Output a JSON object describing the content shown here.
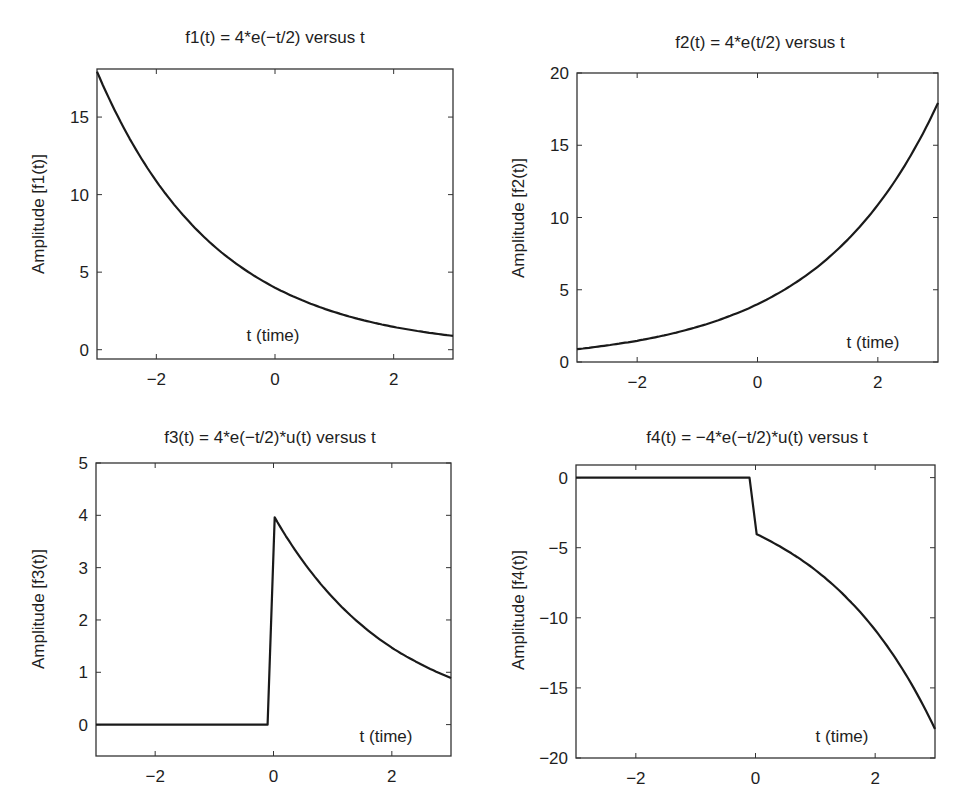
{
  "figure": {
    "layout": "2x2 subplots",
    "line_color": "#1a1a1a",
    "axes_color": "#333333",
    "background": "#ffffff"
  },
  "chart_data": [
    {
      "type": "line",
      "id": "f1",
      "title": "f1(t) = 4*e(−t/2) versus t",
      "xlabel": "t (time)",
      "ylabel": "Amplitude [f1(t)]",
      "xlim": [
        -3,
        3
      ],
      "ylim": [
        -0.6,
        18.1
      ],
      "xticks": [
        -2,
        0,
        2
      ],
      "xtick_labels": [
        "−2",
        "0",
        "2"
      ],
      "yticks": [
        0,
        5,
        10,
        15
      ],
      "ytick_labels": [
        "0",
        "5",
        "10",
        "15"
      ],
      "grid": false,
      "legend": null,
      "series": [
        {
          "name": "f1(t)",
          "x": [
            -3,
            -2.5,
            -2,
            -1.5,
            -1,
            -0.5,
            0,
            0.5,
            1,
            1.5,
            2,
            2.5,
            3
          ],
          "y": [
            17.93,
            13.96,
            10.87,
            8.47,
            6.59,
            5.14,
            4.0,
            3.12,
            2.43,
            1.89,
            1.47,
            1.15,
            0.89
          ]
        }
      ]
    },
    {
      "type": "line",
      "id": "f2",
      "title": "f2(t) = 4*e(t/2) versus t",
      "xlabel": "t (time)",
      "ylabel": "Amplitude [f2(t)]",
      "xlim": [
        -3,
        3
      ],
      "ylim": [
        0,
        20
      ],
      "xticks": [
        -2,
        0,
        2
      ],
      "xtick_labels": [
        "−2",
        "0",
        "2"
      ],
      "yticks": [
        0,
        5,
        10,
        15,
        20
      ],
      "ytick_labels": [
        "0",
        "5",
        "10",
        "15",
        "20"
      ],
      "grid": false,
      "legend": null,
      "series": [
        {
          "name": "f2(t)",
          "x": [
            -3,
            -2.5,
            -2,
            -1.5,
            -1,
            -0.5,
            0,
            0.5,
            1,
            1.5,
            2,
            2.5,
            3
          ],
          "y": [
            0.89,
            1.15,
            1.47,
            1.89,
            2.43,
            3.12,
            4.0,
            5.14,
            6.59,
            8.47,
            10.87,
            13.96,
            17.93
          ]
        }
      ]
    },
    {
      "type": "line",
      "id": "f3",
      "title": "f3(t) = 4*e(−t/2)*u(t) versus t",
      "xlabel": "t (time)",
      "ylabel": "Amplitude [f3(t)]",
      "xlim": [
        -3,
        3
      ],
      "ylim": [
        -0.6,
        5
      ],
      "xticks": [
        -2,
        0,
        2
      ],
      "xtick_labels": [
        "−2",
        "0",
        "2"
      ],
      "yticks": [
        0,
        1,
        2,
        3,
        4,
        5
      ],
      "ytick_labels": [
        "0",
        "1",
        "2",
        "3",
        "4",
        "5"
      ],
      "grid": false,
      "legend": null,
      "series": [
        {
          "name": "f3(t)",
          "x": [
            -3,
            -0.1,
            0.02,
            0.5,
            1,
            1.5,
            2,
            2.5,
            3
          ],
          "y": [
            0,
            0,
            3.96,
            3.12,
            2.43,
            1.89,
            1.47,
            1.15,
            0.89
          ]
        }
      ]
    },
    {
      "type": "line",
      "id": "f4",
      "title": "f4(t) = −4*e(−t/2)*u(t) versus t",
      "xlabel": "t (time)",
      "ylabel": "Amplitude [f4(t)]",
      "xlim": [
        -3,
        3
      ],
      "ylim": [
        -20,
        0.9
      ],
      "xticks": [
        -2,
        0,
        2
      ],
      "xtick_labels": [
        "−2",
        "0",
        "2"
      ],
      "yticks": [
        -20,
        -15,
        -10,
        -5,
        0
      ],
      "ytick_labels": [
        "−20",
        "−15",
        "−10",
        "−5",
        "0"
      ],
      "grid": false,
      "legend": null,
      "series": [
        {
          "name": "f4(t)",
          "x": [
            -3,
            -0.1,
            0.02,
            0.5,
            1,
            1.5,
            2,
            2.5,
            3
          ],
          "y": [
            0,
            0,
            -4.04,
            -5.14,
            -6.59,
            -8.47,
            -10.87,
            -13.96,
            -17.93
          ]
        }
      ]
    }
  ],
  "panels": [
    {
      "title": "f1(t) = 4*e(−t/2) versus t",
      "ylabel": "Amplitude [f1(t)]",
      "xlabel": "t (time)"
    },
    {
      "title": "f2(t) = 4*e(t/2) versus t",
      "ylabel": "Amplitude [f2(t)]",
      "xlabel": "t (time)"
    },
    {
      "title": "f3(t) = 4*e(−t/2)*u(t) versus t",
      "ylabel": "Amplitude [f3(t)]",
      "xlabel": "t (time)"
    },
    {
      "title": "f4(t) = −4*e(−t/2)*u(t) versus t",
      "ylabel": "Amplitude [f4(t)]",
      "xlabel": "t (time)"
    }
  ]
}
